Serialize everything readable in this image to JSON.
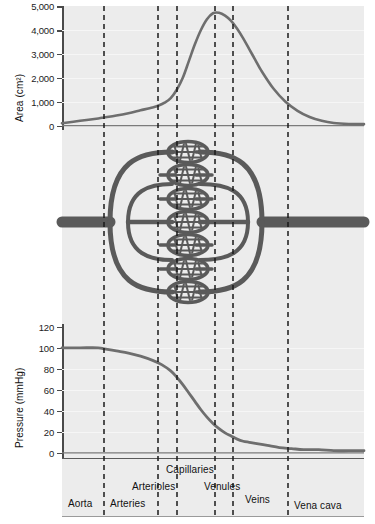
{
  "figure": {
    "title": "",
    "background_color": "#ececec",
    "curve_color": "#6e6e6e",
    "vessel_color": "#5a5a5a",
    "divider_color": "#1a1a1a"
  },
  "chart_data": [
    {
      "type": "line",
      "title": "",
      "subtitle": "",
      "xlabel": "",
      "ylabel": "Area (cm²)",
      "ylim": [
        0,
        5000
      ],
      "xlim": [
        0,
        100
      ],
      "grid": true,
      "legend": "none",
      "yticks": [
        "0",
        "1,000",
        "2,000",
        "3,000",
        "4,000",
        "5,000"
      ],
      "ytick_values": [
        0,
        1000,
        2000,
        3000,
        4000,
        5000
      ],
      "x": [
        0,
        6,
        12,
        14,
        18,
        22,
        26,
        30,
        32,
        34,
        36,
        38,
        40,
        42,
        44,
        46,
        48,
        50,
        52,
        54,
        56,
        58,
        60,
        62,
        64,
        66,
        70,
        74,
        78,
        82,
        86,
        90,
        95,
        100
      ],
      "values": [
        100,
        200,
        300,
        340,
        420,
        520,
        640,
        760,
        840,
        960,
        1150,
        1500,
        2000,
        2700,
        3400,
        4000,
        4450,
        4700,
        4720,
        4600,
        4380,
        4050,
        3650,
        3200,
        2750,
        2300,
        1550,
        1000,
        620,
        360,
        200,
        110,
        70,
        60
      ],
      "notes": "Total cross-sectional area peaks in the capillaries"
    },
    {
      "type": "line",
      "title": "",
      "subtitle": "",
      "xlabel": "",
      "ylabel": "Pressure (mmHg)",
      "ylim": [
        0,
        120
      ],
      "xlim": [
        0,
        100
      ],
      "grid": true,
      "legend": "none",
      "yticks": [
        "0",
        "20",
        "40",
        "60",
        "80",
        "100",
        "120"
      ],
      "ytick_values": [
        0,
        20,
        40,
        60,
        80,
        100,
        120
      ],
      "x": [
        0,
        6,
        12,
        14,
        18,
        22,
        26,
        30,
        33,
        36,
        38,
        40,
        42,
        44,
        46,
        48,
        50,
        52,
        54,
        56,
        58,
        60,
        62,
        64,
        68,
        72,
        76,
        80,
        85,
        90,
        95,
        100
      ],
      "values": [
        100,
        100,
        100,
        99,
        97,
        95,
        92,
        88,
        84,
        78,
        72,
        65,
        57,
        49,
        41,
        34,
        28,
        23,
        19,
        16,
        13,
        11,
        10,
        9,
        7,
        5,
        4,
        3,
        3,
        2,
        2,
        2
      ],
      "notes": "Blood pressure falls steeply across the arterioles"
    }
  ],
  "segments": [
    {
      "name": "Aorta",
      "label": "Aorta",
      "row": 3
    },
    {
      "name": "Arteries",
      "label": "Arteries",
      "row": 3
    },
    {
      "name": "Arterioles",
      "label": "Arterioles",
      "row": 2
    },
    {
      "name": "Capillaries",
      "label": "Capillaries",
      "row": 1
    },
    {
      "name": "Venules",
      "label": "Venules",
      "row": 2
    },
    {
      "name": "Veins",
      "label": "Veins",
      "row": 3
    },
    {
      "name": "Vena cava",
      "label": "Vena cava",
      "row": 3
    }
  ],
  "dividers": {
    "x_positions": [
      104,
      158,
      177,
      215,
      233,
      288
    ],
    "style": "dashed"
  },
  "diagram": {
    "name": "vascular-branching-diagram",
    "capillary_bed_count": 7
  }
}
